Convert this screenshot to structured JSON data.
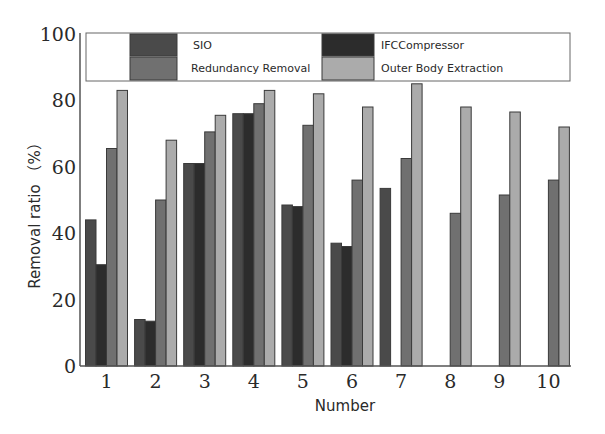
{
  "chart_data": {
    "type": "bar",
    "title": "",
    "xlabel": "Number",
    "ylabel": "Removal ratio （%）",
    "ylim": [
      0,
      100
    ],
    "yticks": [
      0,
      20,
      40,
      60,
      80,
      100
    ],
    "grid": false,
    "legend_position": "top (inside plot, 2x2)",
    "categories": [
      "1",
      "2",
      "3",
      "4",
      "5",
      "6",
      "7",
      "8",
      "9",
      "10"
    ],
    "series": [
      {
        "name": "SIO",
        "color": "#4a4a4a",
        "values": [
          44,
          14,
          61,
          76,
          48.5,
          37,
          53.5,
          0,
          0,
          0
        ]
      },
      {
        "name": "IFCCompressor",
        "color": "#2c2c2c",
        "values": [
          30.5,
          13.5,
          61,
          76,
          48,
          36,
          0,
          0,
          0,
          0
        ]
      },
      {
        "name": "Redundancy Removal",
        "color": "#707070",
        "values": [
          65.5,
          50,
          70.5,
          79,
          72.5,
          56,
          62.5,
          46,
          51.5,
          56
        ]
      },
      {
        "name": "Outer Body Extraction",
        "color": "#ababab",
        "values": [
          83,
          68,
          75.5,
          83,
          82,
          78,
          85,
          78,
          76.5,
          72
        ]
      }
    ]
  },
  "legend": {
    "items": [
      {
        "label": "SIO"
      },
      {
        "label": "IFCCompressor"
      },
      {
        "label": "Redundancy Removal"
      },
      {
        "label": "Outer Body Extraction"
      }
    ]
  },
  "axes": {
    "x_title": "Number",
    "y_title": "Removal ratio （%）"
  }
}
